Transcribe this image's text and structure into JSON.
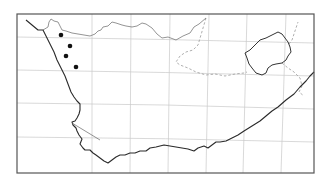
{
  "map": {
    "type": "distribution-map",
    "region": "Western Cape / southern Africa",
    "frame": {
      "x": 17,
      "y": 14,
      "width": 297,
      "height": 159
    },
    "colors": {
      "coast": "#2a2a2a",
      "border": "#7a7a7a",
      "grid": "#c8c8c8",
      "point": "#111111"
    },
    "records": [
      {
        "x": 61,
        "y": 35
      },
      {
        "x": 70,
        "y": 46
      },
      {
        "x": 66,
        "y": 56
      },
      {
        "x": 76,
        "y": 67
      }
    ]
  }
}
